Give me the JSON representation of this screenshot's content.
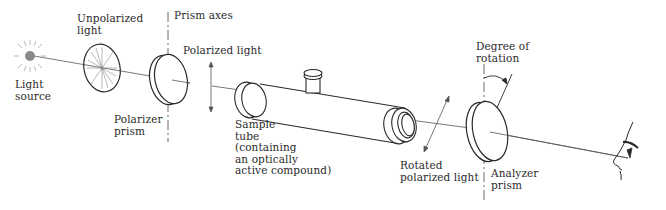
{
  "diagram": {
    "labels": {
      "light_source": "Light\nsource",
      "unpolarized_light": "Unpolarized\nlight",
      "prism_axes": "Prism axes",
      "polarized_light": "Polarized light",
      "polarizer_prism": "Polarizer\nprism",
      "sample_tube": "Sample\ntube\n(containing\nan optically\nactive compound)",
      "degree_of_rotation": "Degree of\nrotation",
      "rotated_polarized_light": "Rotated\npolarized light",
      "analyzer_prism": "Analyzer\nprism"
    },
    "components": [
      {
        "id": "light-source",
        "icon": "light-source-icon"
      },
      {
        "id": "unpolarized-disk",
        "icon": "unpolarized-light-icon"
      },
      {
        "id": "polarizer-prism",
        "icon": "polarizer-prism-icon"
      },
      {
        "id": "sample-tube",
        "icon": "sample-tube-icon"
      },
      {
        "id": "analyzer-prism",
        "icon": "analyzer-prism-icon"
      },
      {
        "id": "observer-eye",
        "icon": "observer-face-icon"
      }
    ],
    "colors": {
      "line": "#2a2a2a",
      "beam": "#555555",
      "source_fill": "#8a8a8a",
      "background": "#ffffff"
    }
  }
}
